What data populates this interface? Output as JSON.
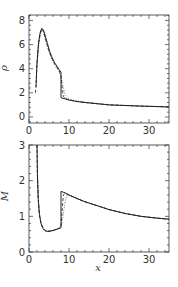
{
  "chart_data": [
    {
      "type": "line",
      "title": "",
      "xlabel": "",
      "ylabel": "ρ",
      "xlim": [
        0,
        35
      ],
      "ylim": [
        -0.5,
        8.45
      ],
      "xticks": [
        0,
        10,
        20,
        30
      ],
      "yticks": [
        0,
        2,
        4,
        6,
        8
      ],
      "xtick_labels": [
        "0",
        "10",
        "20",
        "30"
      ],
      "ytick_labels": [
        "0",
        "2",
        "4",
        "6",
        "8"
      ],
      "grid": false,
      "legend": null,
      "series": [
        {
          "name": "solid",
          "style": "solid",
          "x": [
            1.75,
            2.0,
            2.4,
            2.8,
            3.2,
            3.6,
            4.0,
            4.6,
            5.2,
            5.8,
            6.4,
            7.0,
            7.6,
            8.0,
            8.0,
            9.0,
            10.0,
            12.0,
            14.0,
            17.0,
            20.0,
            24.0,
            28.0,
            32.0,
            35.0
          ],
          "y": [
            2.5,
            4.5,
            6.2,
            7.0,
            7.35,
            7.2,
            6.8,
            6.1,
            5.4,
            4.9,
            4.5,
            4.2,
            3.9,
            3.7,
            1.6,
            1.5,
            1.4,
            1.28,
            1.2,
            1.1,
            1.0,
            0.95,
            0.9,
            0.86,
            0.83
          ]
        },
        {
          "name": "dashed",
          "style": "dashed",
          "x": [
            1.6,
            1.75,
            2.0,
            2.4,
            2.8,
            3.2,
            3.6,
            4.0,
            4.6,
            5.2,
            5.8,
            6.4,
            7.0,
            7.6,
            8.0,
            8.3,
            8.6,
            9.0,
            10.0,
            12.0,
            14.0,
            17.0,
            20.0,
            24.0,
            28.0,
            32.0,
            35.0
          ],
          "y": [
            2.0,
            2.5,
            4.4,
            6.1,
            6.9,
            7.3,
            7.1,
            6.6,
            5.9,
            5.3,
            4.8,
            4.4,
            4.1,
            3.8,
            3.4,
            2.4,
            1.7,
            1.55,
            1.42,
            1.28,
            1.2,
            1.1,
            1.0,
            0.95,
            0.9,
            0.86,
            0.83
          ]
        },
        {
          "name": "dotted",
          "style": "dotted",
          "x": [
            2.0,
            2.4,
            2.8,
            3.2,
            3.6,
            4.0,
            4.6,
            5.2,
            5.8,
            6.4,
            7.0,
            7.6,
            8.0,
            8.5,
            9.0,
            9.5,
            10.0,
            12.0,
            14.0,
            17.0,
            20.0,
            24.0,
            28.0,
            32.0,
            35.0
          ],
          "y": [
            4.2,
            5.9,
            6.8,
            7.15,
            7.0,
            6.5,
            5.8,
            5.2,
            4.7,
            4.3,
            4.0,
            3.7,
            3.3,
            2.6,
            1.8,
            1.6,
            1.48,
            1.32,
            1.22,
            1.12,
            1.02,
            0.96,
            0.91,
            0.87,
            0.84
          ]
        }
      ]
    },
    {
      "type": "line",
      "title": "",
      "xlabel": "x",
      "ylabel": "M",
      "xlim": [
        0,
        35
      ],
      "ylim": [
        0,
        3
      ],
      "xticks": [
        0,
        10,
        20,
        30
      ],
      "yticks": [
        0,
        1,
        2,
        3
      ],
      "xtick_labels": [
        "0",
        "10",
        "20",
        "30"
      ],
      "ytick_labels": [
        "0",
        "1",
        "2",
        "3"
      ],
      "grid": false,
      "legend": null,
      "series": [
        {
          "name": "solid",
          "style": "solid",
          "x": [
            2.0,
            2.1,
            2.3,
            2.6,
            3.0,
            3.5,
            4.0,
            4.5,
            5.0,
            5.5,
            6.0,
            6.5,
            7.0,
            7.5,
            8.0,
            8.0,
            9.0,
            10.0,
            12.0,
            14.0,
            17.0,
            20.0,
            24.0,
            28.0,
            32.0,
            35.0
          ],
          "y": [
            3.0,
            2.2,
            1.5,
            1.05,
            0.8,
            0.66,
            0.6,
            0.58,
            0.58,
            0.59,
            0.6,
            0.62,
            0.64,
            0.66,
            0.68,
            1.7,
            1.66,
            1.6,
            1.5,
            1.41,
            1.3,
            1.19,
            1.08,
            1.0,
            0.95,
            0.92
          ]
        },
        {
          "name": "dashed",
          "style": "dashed",
          "x": [
            2.0,
            2.1,
            2.3,
            2.6,
            3.0,
            3.5,
            4.0,
            4.5,
            5.0,
            5.5,
            6.0,
            6.5,
            7.0,
            7.5,
            8.0,
            8.3,
            8.6,
            9.0,
            10.0,
            12.0,
            14.0,
            17.0,
            20.0,
            24.0,
            28.0,
            32.0,
            35.0
          ],
          "y": [
            3.0,
            2.2,
            1.5,
            1.05,
            0.8,
            0.66,
            0.6,
            0.58,
            0.58,
            0.59,
            0.6,
            0.62,
            0.64,
            0.66,
            0.7,
            1.2,
            1.6,
            1.65,
            1.6,
            1.5,
            1.41,
            1.3,
            1.19,
            1.08,
            1.0,
            0.95,
            0.92
          ]
        },
        {
          "name": "dotted",
          "style": "dotted",
          "x": [
            2.1,
            2.3,
            2.6,
            3.0,
            3.5,
            4.0,
            4.5,
            5.0,
            5.5,
            6.0,
            6.5,
            7.0,
            7.5,
            8.0,
            8.5,
            9.0,
            9.5,
            10.0,
            12.0,
            14.0,
            17.0,
            20.0,
            24.0,
            28.0,
            32.0,
            35.0
          ],
          "y": [
            2.3,
            1.55,
            1.08,
            0.82,
            0.67,
            0.61,
            0.59,
            0.59,
            0.6,
            0.61,
            0.63,
            0.65,
            0.67,
            0.72,
            1.0,
            1.4,
            1.6,
            1.58,
            1.49,
            1.4,
            1.3,
            1.19,
            1.08,
            1.0,
            0.95,
            0.92
          ]
        }
      ]
    }
  ]
}
